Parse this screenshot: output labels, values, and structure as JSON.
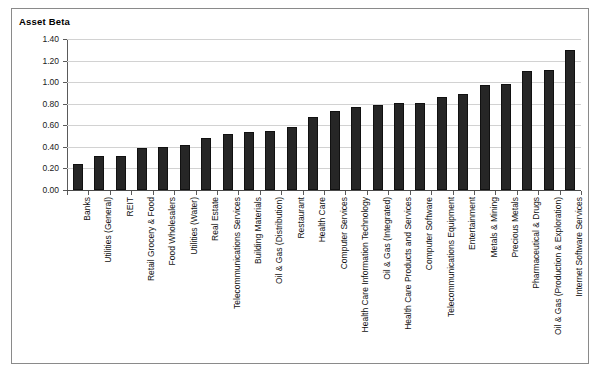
{
  "chart": {
    "title": "Asset Beta"
  },
  "chart_data": {
    "type": "bar",
    "title": "Asset Beta",
    "xlabel": "",
    "ylabel": "",
    "ylim": [
      0.0,
      1.4
    ],
    "yticks": [
      "0.00",
      "0.20",
      "0.40",
      "0.60",
      "0.80",
      "1.00",
      "1.20",
      "1.40"
    ],
    "ytick_values": [
      0.0,
      0.2,
      0.4,
      0.6,
      0.8,
      1.0,
      1.2,
      1.4
    ],
    "grid": true,
    "legend": false,
    "orientation": "vertical",
    "sorted": "ascending",
    "categories": [
      "Banks",
      "Utilities (General)",
      "REIT",
      "Retail Grocery & Food",
      "Food Wholesalers",
      "Utilities (Water)",
      "Real Estate",
      "Telecommunications Services",
      "Building Materials",
      "Oil & Gas (Distribution)",
      "Restaurant",
      "Health Care",
      "Computer Services",
      "Health Care Information Technology",
      "Oil & Gas (Integrated)",
      "Health Care Products and Services",
      "Computer Software",
      "Telecommunications Equipment",
      "Entertainment",
      "Metals & Mining",
      "Precious Metals",
      "Pharmaceutical & Drugs",
      "Oil & Gas (Production & Exploration)",
      "Internet Software Services"
    ],
    "values": [
      0.24,
      0.32,
      0.32,
      0.39,
      0.4,
      0.42,
      0.48,
      0.52,
      0.54,
      0.55,
      0.58,
      0.68,
      0.73,
      0.77,
      0.79,
      0.81,
      0.81,
      0.86,
      0.89,
      0.97,
      0.98,
      1.1,
      1.11,
      1.3
    ],
    "bar_color": "#262626"
  }
}
